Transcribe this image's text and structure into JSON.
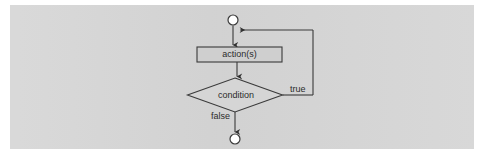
{
  "figure": {
    "panel_background": "#d5d5d5",
    "page_background": "#ffffff",
    "stroke_color": "#3a3a3a",
    "node_fill": "#cfcfcf",
    "terminal_fill": "#ffffff",
    "text_color": "#2b2b2b"
  },
  "diagram": {
    "type": "uml-activity-diagram",
    "nodes": [
      {
        "id": "start",
        "kind": "initial-state",
        "label": "",
        "cx": 233,
        "cy": 20,
        "r": 5
      },
      {
        "id": "action",
        "kind": "action-state",
        "label": "action(s)",
        "x": 197,
        "y": 47,
        "w": 85,
        "h": 15
      },
      {
        "id": "condition",
        "kind": "decision",
        "label": "condition",
        "cx": 235,
        "cy": 95,
        "w": 95,
        "h": 34
      },
      {
        "id": "end",
        "kind": "final-state",
        "label": "",
        "cx": 235,
        "cy": 139,
        "r": 5
      }
    ],
    "edges": [
      {
        "id": "start-to-action",
        "from": "start",
        "to": "action",
        "label": ""
      },
      {
        "id": "action-to-condition",
        "from": "action",
        "to": "condition",
        "label": ""
      },
      {
        "id": "condition-true-loop",
        "from": "condition",
        "to": "start",
        "label": "true"
      },
      {
        "id": "condition-false-end",
        "from": "condition",
        "to": "end",
        "label": "false"
      }
    ],
    "labels": {
      "action": "action(s)",
      "condition": "condition",
      "true_branch": "true",
      "false_branch": "false"
    }
  },
  "caption": {
    "text": ""
  }
}
